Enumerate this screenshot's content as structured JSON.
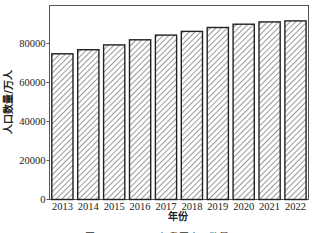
{
  "chart_data": {
    "type": "bar",
    "title": "",
    "xlabel": "年份",
    "ylabel": "人口数量/万人",
    "categories": [
      "2013",
      "2014",
      "2015",
      "2016",
      "2017",
      "2018",
      "2019",
      "2020",
      "2021",
      "2022"
    ],
    "values": [
      74700,
      76800,
      79300,
      81900,
      84300,
      86200,
      88200,
      89900,
      91100,
      91600
    ],
    "ylim": [
      0,
      100000
    ],
    "yticks": [
      0,
      20000,
      40000,
      60000,
      80000
    ],
    "ytick_labels": [
      "0",
      "20000",
      "40000",
      "60000",
      "80000"
    ],
    "grid": false,
    "legend": null,
    "bar_style": "white fill with diagonal hatch, black edge",
    "colors": {
      "edge": "#222222",
      "hatch": "#333333",
      "fill": "#ffffff"
    }
  },
  "caption": "图 2013—2022年我国人口数量"
}
